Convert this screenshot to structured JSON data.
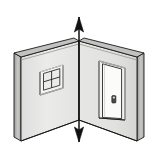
{
  "figure": {
    "type": "line-art-illustration",
    "canvas": {
      "width": 159,
      "height": 155,
      "background": "#ffffff"
    }
  },
  "colors": {
    "outline": "#1a1a1a",
    "wall_face_left": "#e9e9e7",
    "wall_face_right": "#e4e4e2",
    "wall_top_band": "#bdbdbb",
    "wall_edge_dark": "#8f8f8d",
    "wall_edge_mid": "#c8c8c6",
    "floor_line": "#1a1a1a",
    "window_frame": "#f2f2f0",
    "window_glass": "#ededeb",
    "window_shadow": "#b9b9b7",
    "door_face": "#fbfbfa",
    "door_frame": "#f0f0ee",
    "door_shadow": "#b5b5b3",
    "knob": "#4a4a4a",
    "arrow": "#111111"
  },
  "geometry": {
    "corner_x": 79,
    "corner_top_y": 41,
    "corner_bottom_y": 120,
    "left_wall_outer_x": 14,
    "right_wall_outer_x": 144,
    "left_wall_top_outer_y": 53,
    "right_wall_top_outer_y": 53,
    "left_wall_bottom_outer_y": 137,
    "right_wall_bottom_outer_y": 137,
    "wall_thickness_px": 7
  },
  "parts": {
    "left_wall": {
      "label": "Left wall",
      "has_window": true
    },
    "right_wall": {
      "label": "Right wall",
      "has_door": true
    },
    "corner_edge": {
      "label": "Interior corner edge"
    },
    "window": {
      "label": "Window",
      "panes_rows": 2,
      "panes_cols": 2,
      "x": 40,
      "y": 64,
      "width": 24,
      "height": 30
    },
    "door": {
      "label": "Door",
      "x": 99,
      "y": 61,
      "width": 26,
      "height": 56,
      "knob": {
        "label": "Door handle",
        "x": 112,
        "y": 96,
        "width": 4,
        "height": 7
      }
    },
    "arrow": {
      "label": "Vertical double-headed arrow",
      "direction": "up-down",
      "x": 79,
      "top_y": 17,
      "bottom_y": 142,
      "head_length": 13,
      "head_width": 9
    }
  },
  "annotations": {
    "alt_text": "Isometric drawing of the inside corner of a room formed by two walls; the left wall contains a four-pane window and the right wall contains a closed door with a handle. A vertical double-headed arrow runs along the vertical corner line, extending above and below the walls."
  }
}
